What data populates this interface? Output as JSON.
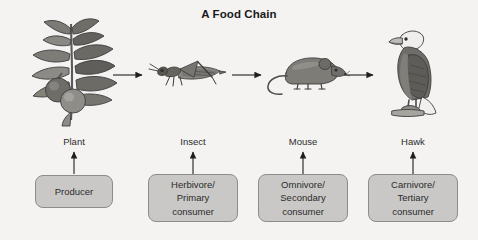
{
  "page": {
    "title": "A Food Chain",
    "background_color": "#f4f3f2",
    "box_fill_color": "#c9c8c6",
    "box_border_color": "#8d8c8a",
    "arrow_color": "#1f1f1f",
    "text_color": "#2b2b2b"
  },
  "chain": {
    "organisms": [
      {
        "label": "Plant",
        "icon": "plant-illustration",
        "role_lines": [
          "Producer"
        ],
        "role_text": "Producer"
      },
      {
        "label": "Insect",
        "icon": "grasshopper-illustration",
        "role_lines": [
          "Herbivore/",
          "Primary",
          "consumer"
        ],
        "role_text": "Herbivore/ Primary consumer"
      },
      {
        "label": "Mouse",
        "icon": "mouse-illustration",
        "role_lines": [
          "Omnivore/",
          "Secondary",
          "consumer"
        ],
        "role_text": "Omnivore/ Secondary consumer"
      },
      {
        "label": "Hawk",
        "icon": "eagle-illustration",
        "role_lines": [
          "Carnivore/",
          "Tertiary",
          "consumer"
        ],
        "role_text": "Carnivore/ Tertiary consumer"
      }
    ],
    "flow_arrows": [
      {
        "from": "Plant",
        "to": "Insect",
        "direction": "right"
      },
      {
        "from": "Insect",
        "to": "Mouse",
        "direction": "right"
      },
      {
        "from": "Mouse",
        "to": "Hawk",
        "direction": "right"
      }
    ],
    "role_arrows": [
      {
        "from": "Producer",
        "to": "Plant",
        "direction": "up"
      },
      {
        "from": "Herbivore/ Primary consumer",
        "to": "Insect",
        "direction": "up"
      },
      {
        "from": "Omnivore/ Secondary consumer",
        "to": "Mouse",
        "direction": "up"
      },
      {
        "from": "Carnivore/ Tertiary consumer",
        "to": "Hawk",
        "direction": "up"
      }
    ]
  }
}
